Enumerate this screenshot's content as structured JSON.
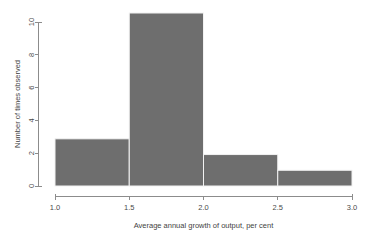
{
  "chart_data": {
    "type": "bar",
    "title": "",
    "subtitle": "",
    "xlabel": "Average annual growth of output, per cent",
    "ylabel": "Number of times observed",
    "categories": [
      "1.0-1.5",
      "1.5-2.0",
      "2.0-2.5",
      "2.5-3.0"
    ],
    "bin_edges": [
      1.0,
      1.5,
      2.0,
      2.5,
      3.0
    ],
    "values": [
      3,
      11,
      2,
      1
    ],
    "bins": [
      {
        "from": 1.0,
        "to": 1.5,
        "count": 3
      },
      {
        "from": 1.5,
        "to": 2.0,
        "count": 11
      },
      {
        "from": 2.0,
        "to": 2.5,
        "count": 2
      },
      {
        "from": 2.5,
        "to": 3.0,
        "count": 1
      }
    ],
    "xlim": [
      1.0,
      3.0
    ],
    "ylim": [
      0,
      11
    ],
    "x_ticks": [
      1.0,
      1.5,
      2.0,
      2.5,
      3.0
    ],
    "x_tick_labels": [
      "1.0",
      "1.5",
      "2.0",
      "2.5",
      "3.0"
    ],
    "y_ticks": [
      0,
      2,
      4,
      6,
      8,
      10
    ],
    "y_tick_labels": [
      "0",
      "2",
      "4",
      "6",
      "8",
      "10"
    ],
    "grid": false,
    "legend": false,
    "legend_position": "none",
    "bar_color": "#6e6e6e",
    "bar_border_color": "#f2f2f2",
    "axis_color": "#8c8c8c",
    "text_color": "#3f3f3f",
    "background_color": "#ffffff"
  },
  "axis": {
    "x_title": "Average annual growth of output, per cent",
    "y_title": "Number of times observed",
    "x_labels": {
      "t0": "1.0",
      "t1": "1.5",
      "t2": "2.0",
      "t3": "2.5",
      "t4": "3.0"
    },
    "y_labels": {
      "t0": "0",
      "t1": "2",
      "t2": "4",
      "t3": "6",
      "t4": "8",
      "t5": "10"
    }
  }
}
